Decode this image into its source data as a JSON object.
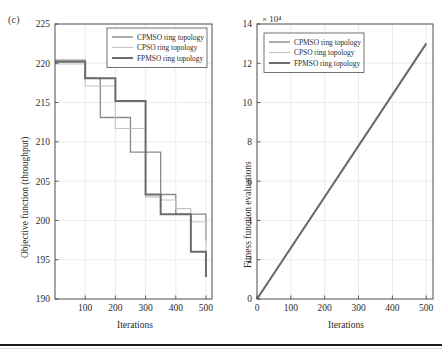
{
  "figure": {
    "panel_label": "(c)",
    "accent_colors": {
      "cpmso": "#7f7f7f",
      "cpso": "#bfbfbf",
      "fpmso": "#6b6b6b",
      "axis": "#4d4d4d",
      "grid": "#e2e2e2"
    }
  },
  "legend": {
    "items": [
      {
        "label": "CPMSO ring topology",
        "color": "#7f7f7f",
        "width": 1.3
      },
      {
        "label": "CPSO ring topology",
        "color": "#c4c4c4",
        "width": 1.1
      },
      {
        "label": "FPMSO ring topology",
        "color": "#6b6b6b",
        "width": 2.0
      }
    ]
  },
  "chart_data": [
    {
      "id": "objective-function",
      "type": "line",
      "drawstyle": "steps-post",
      "title": "",
      "xlabel": "Iterations",
      "ylabel": "Objective function (throughput)",
      "xlim": [
        0,
        520
      ],
      "ylim": [
        190,
        225
      ],
      "xticks": [
        100,
        200,
        300,
        400,
        500
      ],
      "yticks": [
        190,
        195,
        200,
        205,
        210,
        215,
        220,
        225
      ],
      "grid": true,
      "legend_position": "top-right",
      "x": [
        0,
        50,
        100,
        150,
        200,
        250,
        300,
        350,
        400,
        450,
        500
      ],
      "series": [
        {
          "name": "CPMSO ring topology",
          "color": "#8a8a8a",
          "width": 1.3,
          "values": [
            220.4,
            220.4,
            218.1,
            213.1,
            213.1,
            208.7,
            208.7,
            203.3,
            200.8,
            200.8,
            197.4
          ]
        },
        {
          "name": "CPSO ring topology",
          "color": "#c4c4c4",
          "width": 1.1,
          "values": [
            219.9,
            219.9,
            217.1,
            217.1,
            211.7,
            211.7,
            203.0,
            202.6,
            201.5,
            199.8,
            194.6
          ]
        },
        {
          "name": "FPMSO ring topology",
          "color": "#6b6b6b",
          "width": 2.0,
          "values": [
            220.2,
            220.2,
            218.1,
            218.1,
            215.2,
            215.2,
            203.3,
            200.8,
            200.8,
            196.0,
            192.8
          ]
        }
      ]
    },
    {
      "id": "fitness-function-evaluations",
      "type": "line",
      "drawstyle": "linear",
      "title": "",
      "xlabel": "Iterations",
      "ylabel": "Fitness function evaluations",
      "y_exponent": "× 10⁴",
      "xlim": [
        0,
        520
      ],
      "ylim": [
        0,
        14
      ],
      "xticks": [
        0,
        100,
        200,
        300,
        400,
        500
      ],
      "yticks": [
        0,
        2,
        4,
        6,
        8,
        10,
        12,
        14
      ],
      "grid": true,
      "legend_position": "top-left",
      "x": [
        0,
        500
      ],
      "series": [
        {
          "name": "CPMSO ring topology",
          "color": "#8a8a8a",
          "width": 1.3,
          "values": [
            0,
            13.0
          ]
        },
        {
          "name": "CPSO ring topology",
          "color": "#c4c4c4",
          "width": 1.1,
          "values": [
            0,
            13.0
          ]
        },
        {
          "name": "FPMSO ring topology",
          "color": "#6b6b6b",
          "width": 2.0,
          "values": [
            0,
            13.0
          ]
        }
      ]
    }
  ]
}
